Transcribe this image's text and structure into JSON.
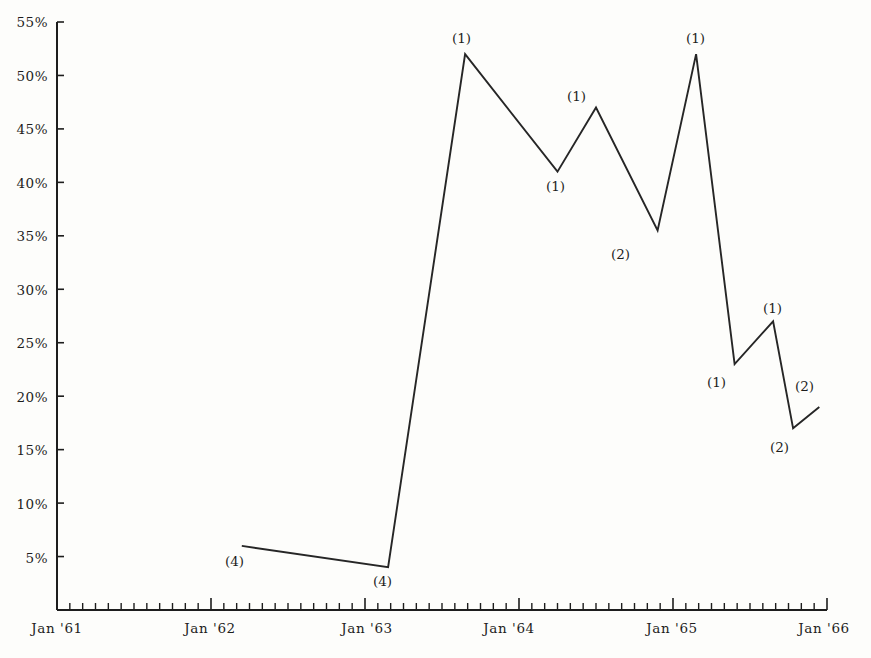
{
  "chart_data": {
    "type": "line",
    "title": "",
    "subtitle": "",
    "xlabel": "",
    "ylabel": "",
    "grid": false,
    "legend": "none",
    "line_color": "#262626",
    "background_color": "#fdfdfb",
    "axis_color": "#1d1d1d",
    "xlim": [
      "Jan '61",
      "Jan '66"
    ],
    "ylim": [
      0,
      55
    ],
    "y_tick_labels": [
      "55%",
      "50%",
      "45%",
      "40%",
      "35%",
      "30%",
      "25%",
      "20%",
      "15%",
      "10%",
      "5%"
    ],
    "y_tick_values": [
      55,
      50,
      45,
      40,
      35,
      30,
      25,
      20,
      15,
      10,
      5
    ],
    "x_tick_labels": [
      "Jan '61",
      "Jan '62",
      "Jan '63",
      "Jan '64",
      "Jan '65",
      "Jan '66"
    ],
    "x_tick_values": [
      1961.0,
      1962.0,
      1963.0,
      1964.0,
      1965.0,
      1966.0
    ],
    "x_minor_ticks_per_major": 12,
    "x": [
      1962.2,
      1963.15,
      1963.65,
      1964.25,
      1964.5,
      1964.9,
      1965.15,
      1965.4,
      1965.65,
      1965.78,
      1965.95
    ],
    "values": [
      6,
      4,
      52,
      41,
      47,
      35.5,
      52,
      23,
      27,
      17,
      19
    ],
    "point_annotations": [
      {
        "label": "(4)",
        "x": 1962.2,
        "y": 6,
        "placement": "below-left"
      },
      {
        "label": "(4)",
        "x": 1963.15,
        "y": 4,
        "placement": "below"
      },
      {
        "label": "(1)",
        "x": 1963.65,
        "y": 52,
        "placement": "above"
      },
      {
        "label": "(1)",
        "x": 1964.25,
        "y": 41,
        "placement": "below"
      },
      {
        "label": "(1)",
        "x": 1964.5,
        "y": 47,
        "placement": "above"
      },
      {
        "label": "(2)",
        "x": 1964.9,
        "y": 35.5,
        "placement": "below"
      },
      {
        "label": "(1)",
        "x": 1965.15,
        "y": 52,
        "placement": "above"
      },
      {
        "label": "(1)",
        "x": 1965.4,
        "y": 23,
        "placement": "below"
      },
      {
        "label": "(1)",
        "x": 1965.65,
        "y": 27,
        "placement": "above"
      },
      {
        "label": "(2)",
        "x": 1965.78,
        "y": 17,
        "placement": "below"
      },
      {
        "label": "(2)",
        "x": 1965.95,
        "y": 19,
        "placement": "above-right"
      }
    ]
  },
  "axes": {
    "y_labels": [
      {
        "text": "55%",
        "top": 14
      },
      {
        "text": "50%",
        "top": 68
      },
      {
        "text": "45%",
        "top": 121
      },
      {
        "text": "40%",
        "top": 175
      },
      {
        "text": "35%",
        "top": 228
      },
      {
        "text": "30%",
        "top": 282
      },
      {
        "text": "25%",
        "top": 335
      },
      {
        "text": "20%",
        "top": 389
      },
      {
        "text": "15%",
        "top": 442
      },
      {
        "text": "10%",
        "top": 496
      },
      {
        "text": "5%",
        "top": 550
      }
    ],
    "x_labels": [
      {
        "text": "Jan '61",
        "left": 57
      },
      {
        "text": "Jan '62",
        "left": 210
      },
      {
        "text": "Jan '63",
        "left": 367
      },
      {
        "text": "Jan '64",
        "left": 509
      },
      {
        "text": "Jan '65",
        "left": 672
      },
      {
        "text": "Jan '66",
        "left": 824
      }
    ]
  },
  "annotations": [
    {
      "text": "(4)",
      "left": 225,
      "top": 553
    },
    {
      "text": "(4)",
      "left": 373,
      "top": 573
    },
    {
      "text": "(1)",
      "left": 452,
      "top": 30
    },
    {
      "text": "(1)",
      "left": 546,
      "top": 178
    },
    {
      "text": "(1)",
      "left": 567,
      "top": 88
    },
    {
      "text": "(2)",
      "left": 611,
      "top": 246
    },
    {
      "text": "(1)",
      "left": 686,
      "top": 30
    },
    {
      "text": "(1)",
      "left": 707,
      "top": 374
    },
    {
      "text": "(1)",
      "left": 763,
      "top": 300
    },
    {
      "text": "(2)",
      "left": 770,
      "top": 439
    },
    {
      "text": "(2)",
      "left": 795,
      "top": 378
    }
  ]
}
